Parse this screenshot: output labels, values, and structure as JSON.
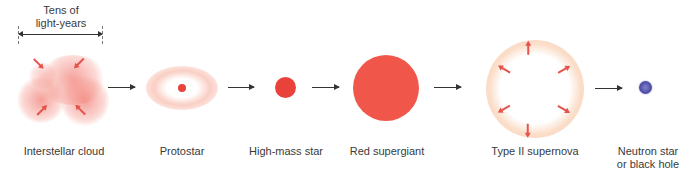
{
  "scale": {
    "label_line1": "Tens of",
    "label_line2": "light-years"
  },
  "stages": [
    {
      "name": "Interstellar cloud"
    },
    {
      "name": "Protostar"
    },
    {
      "name": "High-mass star"
    },
    {
      "name": "Red supergiant"
    },
    {
      "name": "Type II supernova"
    },
    {
      "name": "Neutron star",
      "name_line2": "or black hole"
    }
  ],
  "colors": {
    "star_red": "#e8423a",
    "supergiant_red": "#f0574a",
    "neutron_blue": "#5555aa",
    "arrow": "#333333",
    "ray": "#e5534b"
  }
}
